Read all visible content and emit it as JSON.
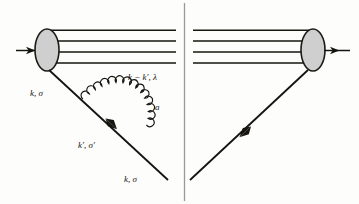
{
  "figure": {
    "kind": "feynman-diagram",
    "background_color": "#fdfdfc",
    "line_color": "#15140f",
    "blob_fill_color": "#cfcfcf",
    "blob_stroke_color": "#1a1a16",
    "labels": {
      "incoming_quark": "k, σ",
      "gluon_momentum": "k − k′, λ",
      "gluon_color_index": "a",
      "intermediate_quark": "k′, σ′",
      "outgoing_quark": "k, σ"
    },
    "elements": {
      "left_blob": "hadron-blob-left",
      "right_blob": "hadron-blob-right",
      "spectator_lines_count": 4,
      "cut_line": "vertical-cut-line",
      "gluon": "gluon-arc-spiral",
      "gluon_coils": 14
    }
  }
}
